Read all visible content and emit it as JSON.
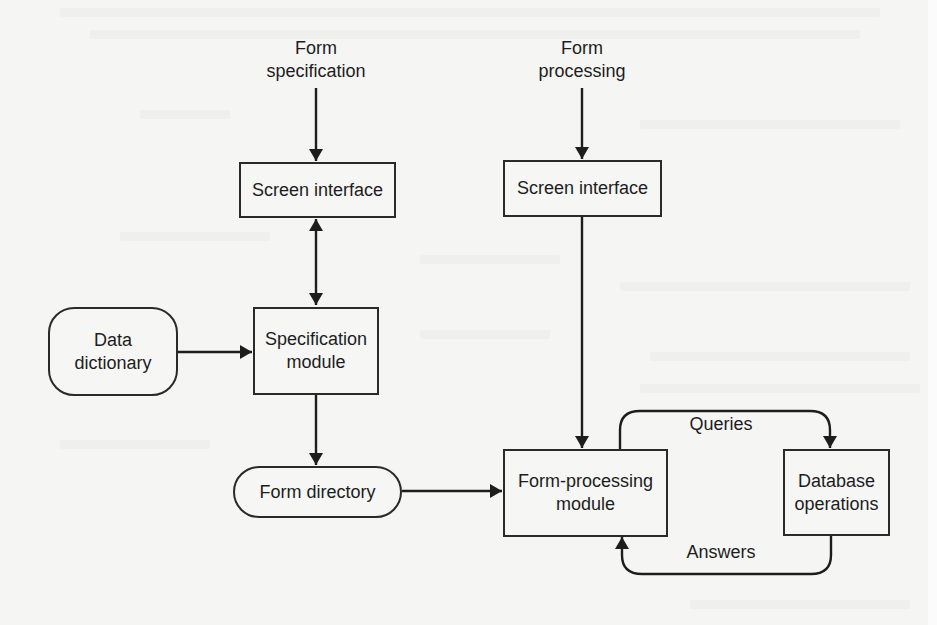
{
  "diagram": {
    "inputs": {
      "form_specification": "Form\nspecification",
      "form_processing": "Form\nprocessing"
    },
    "nodes": {
      "screen_interface_spec": "Screen interface",
      "screen_interface_proc": "Screen interface",
      "data_dictionary": "Data\ndictionary",
      "specification_module": "Specification\nmodule",
      "form_directory": "Form directory",
      "form_processing_module": "Form-processing\nmodule",
      "database_operations": "Database\noperations"
    },
    "edge_labels": {
      "queries": "Queries",
      "answers": "Answers"
    },
    "edges": [
      {
        "from": "Form specification",
        "to": "Screen interface (spec)"
      },
      {
        "from": "Screen interface (spec)",
        "to": "Specification module",
        "bidirectional": true
      },
      {
        "from": "Data dictionary",
        "to": "Specification module"
      },
      {
        "from": "Specification module",
        "to": "Form directory"
      },
      {
        "from": "Form directory",
        "to": "Form-processing module"
      },
      {
        "from": "Form processing",
        "to": "Screen interface (proc)"
      },
      {
        "from": "Screen interface (proc)",
        "to": "Form-processing module"
      },
      {
        "from": "Form-processing module",
        "to": "Database operations",
        "label": "Queries"
      },
      {
        "from": "Database operations",
        "to": "Form-processing module",
        "label": "Answers"
      }
    ],
    "colors": {
      "background": "#f5f5f4",
      "ink": "#1d1d1d"
    }
  }
}
